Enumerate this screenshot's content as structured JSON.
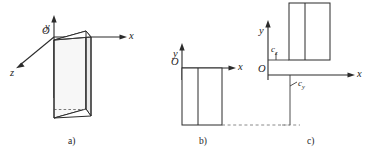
{
  "figure": {
    "panels": [
      {
        "id": "a",
        "caption": "a)",
        "axes": [
          {
            "name": "y",
            "label": "y",
            "direction": "up"
          },
          {
            "name": "x",
            "label": "x",
            "direction": "right"
          },
          {
            "name": "z",
            "label": "z",
            "direction": "down-left"
          }
        ],
        "origin_label": "O",
        "shape": "triangular-prism",
        "hidden_edge": "dashed"
      },
      {
        "id": "b",
        "caption": "b)",
        "axes": [
          {
            "name": "y",
            "label": "y",
            "direction": "up"
          },
          {
            "name": "x",
            "label": "x",
            "direction": "right"
          }
        ],
        "origin_label": "O",
        "shape": "rectangle-with-divider",
        "reference_line": "dashed"
      },
      {
        "id": "c",
        "caption": "c)",
        "axes": [
          {
            "name": "y",
            "label": "y",
            "direction": "up"
          },
          {
            "name": "x",
            "label": "x",
            "direction": "right"
          }
        ],
        "origin_label": "O",
        "shape": "rectangle-with-divider",
        "reference_line": "dashed",
        "dimensions": [
          {
            "name": "cz",
            "symbol": "c",
            "subscript": "z"
          },
          {
            "name": "cy",
            "symbol": "c",
            "subscript": "y"
          }
        ]
      }
    ],
    "colors": {
      "stroke": "#2b2b2b",
      "dashed": "#7d7d7d",
      "face_light": "#f7f7f7",
      "face_mid": "#ebebeb",
      "background": "#ffffff",
      "text": "#1d1d1d"
    }
  }
}
